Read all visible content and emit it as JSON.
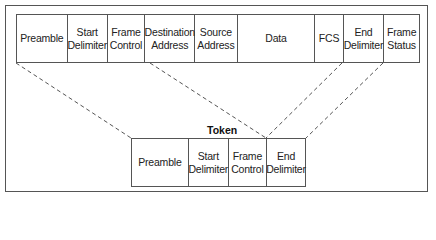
{
  "frame": {
    "fields": [
      {
        "label": "Preamble",
        "width": 54
      },
      {
        "label": "Start\nDelimiter",
        "width": 40
      },
      {
        "label": "Frame\nControl",
        "width": 40
      },
      {
        "label": "Destination\nAddress",
        "width": 50
      },
      {
        "label": "Source\nAddress",
        "width": 45
      },
      {
        "label": "Data",
        "width": 83
      },
      {
        "label": "FCS",
        "width": 30
      },
      {
        "label": "End\nDelimiter",
        "width": 41
      },
      {
        "label": "Frame\nStatus",
        "width": 37
      }
    ]
  },
  "token": {
    "title": "Token",
    "fields": [
      {
        "label": "Preamble",
        "width": 66
      },
      {
        "label": "Start\nDelimiter",
        "width": 40
      },
      {
        "label": "Frame\nControl",
        "width": 40
      },
      {
        "label": "End\nDelimiter",
        "width": 39
      }
    ]
  },
  "colors": {
    "line": "#555555",
    "text": "#222222",
    "background": "#ffffff"
  }
}
